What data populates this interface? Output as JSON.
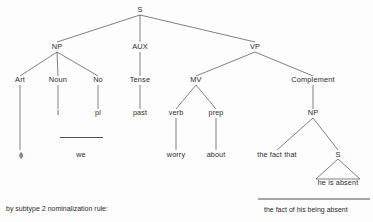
{
  "diagram": {
    "type": "syntactic-phrase-structure-tree",
    "caption_left": "by subtype 2 nominalization rule:",
    "derived_string": "the fact of his being absent",
    "nodes": {
      "root_s": "S",
      "np": "NP",
      "aux": "AUX",
      "vp": "VP",
      "art": "Art",
      "noun": "Noun",
      "no": "No",
      "tense": "Tense",
      "mv": "MV",
      "complement": "Complement",
      "noun_feature": "I",
      "no_feature": "pl",
      "tense_feature": "past",
      "verb": "verb",
      "prep": "prep",
      "embedded_np": "NP",
      "art_terminal": "ϕ",
      "np_lexical": "we",
      "verb_terminal": "worry",
      "prep_terminal": "about",
      "np_left_terminal": "the fact that",
      "embedded_s": "S",
      "embedded_s_terminal": "he is absent"
    }
  }
}
